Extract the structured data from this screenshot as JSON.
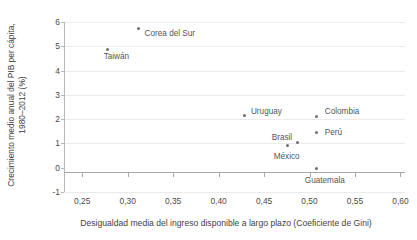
{
  "chart_data": {
    "type": "scatter",
    "title": "",
    "xlabel": "Desigualdad media del ingreso disponible a largo plazo (Coeficiente de Gini)",
    "ylabel_line1": "Crecimiento medio anual del PIB per cápita,",
    "ylabel_line2": "1980–2012 (%)",
    "xlim": [
      0.23,
      0.605
    ],
    "ylim": [
      -1,
      6
    ],
    "xticks": [
      "0,25",
      "0,30",
      "0,35",
      "0,40",
      "0,45",
      "0,50",
      "0,55",
      "0,60"
    ],
    "xtick_values": [
      0.25,
      0.3,
      0.35,
      0.4,
      0.45,
      0.5,
      0.55,
      0.6
    ],
    "yticks": [
      "-1",
      "0",
      "1",
      "2",
      "3",
      "4",
      "5",
      "6"
    ],
    "ytick_values": [
      -1,
      0,
      1,
      2,
      3,
      4,
      5,
      6
    ],
    "grid": true,
    "legend": "none",
    "marker_color": "#6e6e6e",
    "grid_color": "#ebebeb",
    "axis_color": "#a8a8a8",
    "points": [
      {
        "name": "Corea del Sur",
        "x": 0.312,
        "y": 5.72,
        "label_dx": 6,
        "label_dy": 5
      },
      {
        "name": "Taiwán",
        "x": 0.278,
        "y": 4.88,
        "label_dx": -4,
        "label_dy": 8
      },
      {
        "name": "Uruguay",
        "x": 0.429,
        "y": 2.15,
        "label_dx": 6,
        "label_dy": -4
      },
      {
        "name": "Colombia",
        "x": 0.508,
        "y": 2.1,
        "label_dx": 8,
        "label_dy": -5
      },
      {
        "name": "Perú",
        "x": 0.508,
        "y": 1.45,
        "label_dx": 8,
        "label_dy": 0
      },
      {
        "name": "Brasil",
        "x": 0.487,
        "y": 1.05,
        "label_dx": -26,
        "label_dy": -4
      },
      {
        "name": "México",
        "x": 0.476,
        "y": 0.9,
        "label_dx": -14,
        "label_dy": 11
      },
      {
        "name": "Guatemala",
        "x": 0.508,
        "y": -0.05,
        "label_dx": -12,
        "label_dy": 12
      }
    ]
  }
}
